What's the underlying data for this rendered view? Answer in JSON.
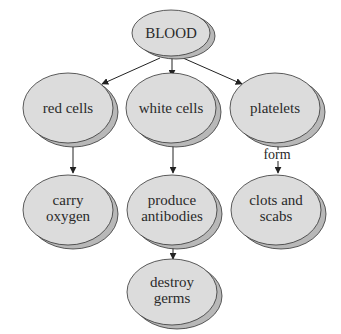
{
  "colors": {
    "node_fill": "#dcdcdc",
    "node_shadow": "#b8b8b8",
    "node_stroke": "#333333",
    "edge": "#222222",
    "background": "#ffffff"
  },
  "nodes": {
    "blood": {
      "lines": [
        "BLOOD"
      ]
    },
    "red_cells": {
      "lines": [
        "red cells"
      ]
    },
    "white_cells": {
      "lines": [
        "white cells"
      ]
    },
    "platelets": {
      "lines": [
        "platelets"
      ]
    },
    "carry_oxygen": {
      "lines": [
        "carry",
        "oxygen"
      ]
    },
    "produce_antibodies": {
      "lines": [
        "produce",
        "antibodies"
      ]
    },
    "clots_scabs": {
      "lines": [
        "clots and",
        "scabs"
      ]
    },
    "destroy_germs": {
      "lines": [
        "destroy",
        "germs"
      ]
    }
  },
  "edges": [
    {
      "from": "BLOOD",
      "to": "red cells",
      "label": ""
    },
    {
      "from": "BLOOD",
      "to": "white cells",
      "label": ""
    },
    {
      "from": "BLOOD",
      "to": "platelets",
      "label": ""
    },
    {
      "from": "red cells",
      "to": "carry oxygen",
      "label": ""
    },
    {
      "from": "white cells",
      "to": "produce antibodies",
      "label": ""
    },
    {
      "from": "platelets",
      "to": "clots and scabs",
      "label": "form"
    },
    {
      "from": "produce antibodies",
      "to": "destroy germs",
      "label": ""
    }
  ],
  "edge_labels": {
    "platelets_to_clots": "form"
  }
}
